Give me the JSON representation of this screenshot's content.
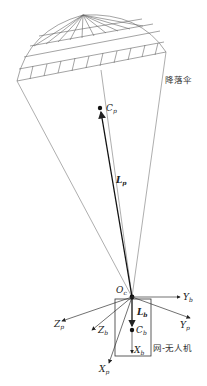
{
  "labels": {
    "parachute": "降落伞",
    "drone": "网-无人机",
    "Cp": {
      "main": "C",
      "sub": "p"
    },
    "Lp": {
      "main": "L",
      "sub": "p"
    },
    "Oc": {
      "main": "O",
      "sub": "c"
    },
    "Yb": {
      "main": "Y",
      "sub": "b"
    },
    "Yp": {
      "main": "Y",
      "sub": "p"
    },
    "Zp": {
      "main": "Z",
      "sub": "p"
    },
    "Zb": {
      "main": "Z",
      "sub": "b"
    },
    "Lb": {
      "main": "L",
      "sub": "b"
    },
    "Cb": {
      "main": "C",
      "sub": "b"
    },
    "Xb": {
      "main": "X",
      "sub": "b"
    },
    "Xp": {
      "main": "X",
      "sub": "p"
    }
  },
  "colors": {
    "line": "#555555",
    "dark": "#111111"
  }
}
